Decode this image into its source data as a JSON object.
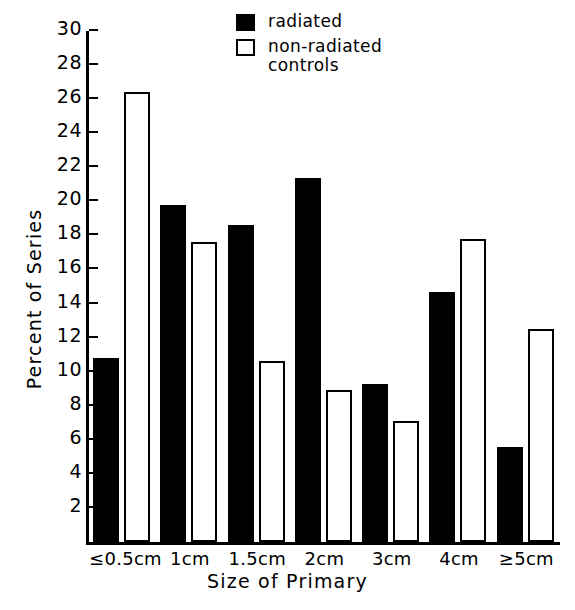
{
  "chart_data": {
    "type": "bar",
    "title": "",
    "xlabel": "Size of Primary",
    "ylabel": "Percent of Series",
    "categories": [
      "≤0.5cm",
      "1cm",
      "1.5cm",
      "2cm",
      "3cm",
      "4cm",
      "≥5cm"
    ],
    "series": [
      {
        "name": "radiated",
        "style": "solid-black",
        "values": [
          10.8,
          19.8,
          18.6,
          21.4,
          9.3,
          14.7,
          5.6
        ]
      },
      {
        "name": "non-radiated\ncontrols",
        "style": "open-white",
        "values": [
          26.4,
          17.6,
          10.6,
          8.9,
          7.1,
          17.8,
          12.5
        ]
      }
    ],
    "ylim": [
      0,
      30
    ],
    "yticks": [
      2,
      4,
      6,
      8,
      10,
      12,
      14,
      16,
      18,
      20,
      22,
      24,
      26,
      28,
      30
    ],
    "ytick_labels": [
      "2",
      "4",
      "6",
      "8",
      "10",
      "12",
      "14",
      "16",
      "18",
      "20",
      "22",
      "24",
      "26",
      "28",
      "30"
    ],
    "grid": false,
    "legend_position": "top-center",
    "colors": {
      "radiated": "#000000",
      "non_radiated_controls": "#ffffff",
      "axis": "#000000",
      "background": "#ffffff"
    }
  },
  "legend": {
    "entries": [
      {
        "label": "radiated",
        "swatch": "filled-square"
      },
      {
        "label": "non-radiated\ncontrols",
        "swatch": "open-square"
      }
    ]
  },
  "axes": {
    "y_title": "Percent of Series",
    "x_title": "Size of Primary"
  }
}
